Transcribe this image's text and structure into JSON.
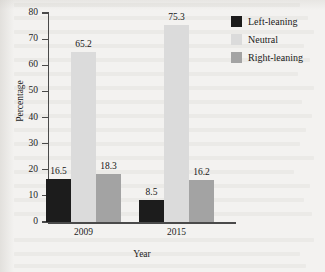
{
  "chart_data": {
    "type": "bar",
    "title": "",
    "subtitle": "",
    "xlabel": "Year",
    "ylabel": "Percentage",
    "categories": [
      "2009",
      "2015"
    ],
    "series": [
      {
        "name": "Left-leaning",
        "color": "#1c1c1c",
        "values": [
          16.5,
          8.5
        ]
      },
      {
        "name": "Neutral",
        "color": "#dbdbdb",
        "values": [
          65.2,
          75.3
        ]
      },
      {
        "name": "Right-leaning",
        "color": "#a3a3a3",
        "values": [
          18.3,
          16.2
        ]
      }
    ],
    "ylim": [
      0,
      80
    ],
    "yticks": [
      0,
      10,
      20,
      30,
      40,
      50,
      60,
      70,
      80
    ],
    "ytick_labels": [
      "0",
      "10",
      "20",
      "30",
      "40",
      "50",
      "60",
      "70",
      "80"
    ],
    "grid": false,
    "legend_position": "top-right",
    "data_labels": [
      "16.5",
      "65.2",
      "18.3",
      "8.5",
      "75.3",
      "16.2"
    ],
    "bar_group_layout": "grouped"
  },
  "axes": {
    "y_title": "Percentage",
    "x_title": "Year",
    "y_tick_labels": [
      "80",
      "70",
      "60",
      "50",
      "40",
      "30",
      "20",
      "10",
      "0"
    ],
    "x_tick_labels": [
      "2009",
      "2015"
    ]
  },
  "legend": {
    "items": [
      {
        "label": "Left-leaning",
        "color": "#1c1c1c"
      },
      {
        "label": "Neutral",
        "color": "#dbdbdb"
      },
      {
        "label": "Right-leaning",
        "color": "#a3a3a3"
      }
    ]
  },
  "bars": [
    {
      "group": "2009",
      "series": "Left-leaning",
      "value": 16.5,
      "label": "16.5",
      "color": "#1c1c1c"
    },
    {
      "group": "2009",
      "series": "Neutral",
      "value": 65.2,
      "label": "65.2",
      "color": "#dbdbdb"
    },
    {
      "group": "2009",
      "series": "Right-leaning",
      "value": 18.3,
      "label": "18.3",
      "color": "#a3a3a3"
    },
    {
      "group": "2015",
      "series": "Left-leaning",
      "value": 8.5,
      "label": "8.5",
      "color": "#1c1c1c"
    },
    {
      "group": "2015",
      "series": "Neutral",
      "value": 75.3,
      "label": "75.3",
      "color": "#dbdbdb"
    },
    {
      "group": "2015",
      "series": "Right-leaning",
      "value": 16.2,
      "label": "16.2",
      "color": "#a3a3a3"
    }
  ]
}
